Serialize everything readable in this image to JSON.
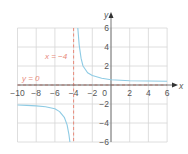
{
  "chart_data": {
    "type": "line",
    "title": "",
    "xlabel": "x",
    "ylabel": "y",
    "xlim": [
      -10,
      6
    ],
    "ylim": [
      -6,
      6
    ],
    "grid": true,
    "x_ticks": [
      -10,
      -8,
      -6,
      -4,
      -2,
      0,
      2,
      4,
      6
    ],
    "y_ticks": [
      6,
      4,
      2,
      -2,
      -4,
      -6
    ],
    "x_tick_labels": [
      "−10",
      "−8",
      "−6",
      "−4",
      "−2",
      "0",
      "2",
      "4",
      "6"
    ],
    "y_tick_labels": [
      "6",
      "4",
      "2",
      "−2",
      "−4",
      "−6"
    ],
    "asymptotes": [
      {
        "type": "vertical",
        "value": -4,
        "label": "x = −4"
      },
      {
        "type": "horizontal",
        "value": 0,
        "label": "y = 0"
      }
    ],
    "series": [
      {
        "name": "right-branch",
        "x": [
          -3.55,
          -3.4,
          -3.2,
          -3.0,
          -2.5,
          -2.0,
          -1.0,
          0,
          2,
          4,
          6
        ],
        "y": [
          6,
          4.2,
          2.8,
          2.0,
          1.3,
          1.0,
          0.7,
          0.55,
          0.45,
          0.42,
          0.4
        ]
      },
      {
        "name": "left-branch",
        "x": [
          -10,
          -9,
          -8,
          -7,
          -6,
          -5.5,
          -5,
          -4.7,
          -4.5,
          -4.4
        ],
        "y": [
          -2.1,
          -2.15,
          -2.2,
          -2.3,
          -2.5,
          -2.8,
          -3.4,
          -4.2,
          -5.2,
          -6
        ]
      }
    ],
    "colors": {
      "curve": "#8ecbe4",
      "asymptote": "#e8897a",
      "grid": "#d6d6d6",
      "axis": "#666666"
    }
  },
  "labels": {
    "x_axis": "x",
    "y_axis": "y",
    "vertical_asymptote": "x = −4",
    "horizontal_asymptote": "y = 0"
  }
}
